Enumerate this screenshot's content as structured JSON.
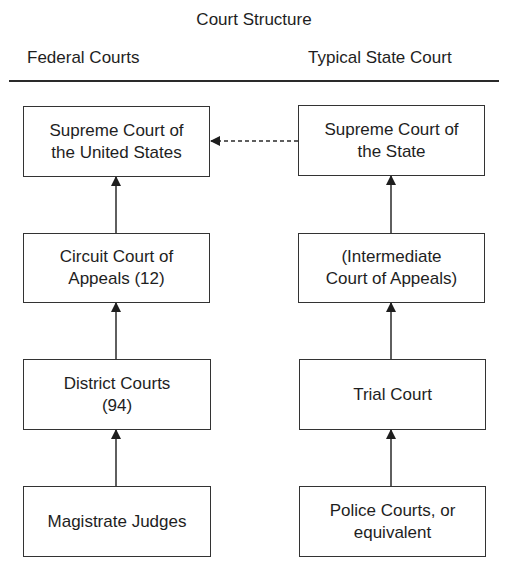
{
  "title": "Court Structure",
  "columns": {
    "federal": "Federal Courts",
    "state": "Typical State Court"
  },
  "federal_boxes": [
    {
      "label": "Supreme Court of\nthe United States"
    },
    {
      "label": "Circuit Court of\nAppeals (12)"
    },
    {
      "label": "District Courts\n(94)"
    },
    {
      "label": "Magistrate Judges"
    }
  ],
  "state_boxes": [
    {
      "label": "Supreme Court of\nthe State"
    },
    {
      "label": "(Intermediate\nCourt of Appeals)"
    },
    {
      "label": "Trial Court"
    },
    {
      "label": "Police Courts, or\nequivalent"
    }
  ],
  "links": [
    {
      "from": "Circuit Court of Appeals (12)",
      "to": "Supreme Court of the United States",
      "style": "solid"
    },
    {
      "from": "District Courts (94)",
      "to": "Circuit Court of Appeals (12)",
      "style": "solid"
    },
    {
      "from": "Magistrate Judges",
      "to": "District Courts (94)",
      "style": "solid"
    },
    {
      "from": "(Intermediate Court of Appeals)",
      "to": "Supreme Court of the State",
      "style": "solid"
    },
    {
      "from": "Trial Court",
      "to": "(Intermediate Court of Appeals)",
      "style": "solid"
    },
    {
      "from": "Police Courts, or equivalent",
      "to": "Trial Court",
      "style": "solid"
    },
    {
      "from": "Supreme Court of the State",
      "to": "Supreme Court of the United States",
      "style": "dashed"
    }
  ]
}
